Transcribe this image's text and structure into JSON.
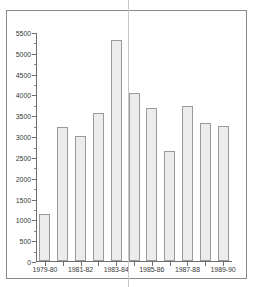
{
  "chart_data": {
    "type": "bar",
    "title": "",
    "subtitle": "",
    "xlabel": "",
    "ylabel": "",
    "categories": [
      "1979-80",
      "1980-81",
      "1981-82",
      "1982-83",
      "1983-84",
      "1984-85",
      "1985-86",
      "1986-87",
      "1987-88",
      "1988-89",
      "1989-90"
    ],
    "values": [
      1120,
      3220,
      3000,
      3560,
      5300,
      4030,
      3670,
      2650,
      3720,
      3320,
      3250
    ],
    "ylim": [
      0,
      5500
    ],
    "ytick_labels": [
      "0",
      "500",
      "1000",
      "1500",
      "2000",
      "2500",
      "3000",
      "3500",
      "4000",
      "4500",
      "5000",
      "5500"
    ],
    "ytick_values": [
      0,
      500,
      1000,
      1500,
      2000,
      2500,
      3000,
      3500,
      4000,
      4500,
      5000,
      5500
    ],
    "xtick_labels_shown": [
      "1979-80",
      "1981-82",
      "1983-84",
      "1985-86",
      "1987-88",
      "1989-90"
    ],
    "grid": false,
    "legend": null,
    "legend_position": "none",
    "bar_fill_color": "#ececec",
    "bar_border_color": "#9a9a9a",
    "axis_color": "#6e6e6e",
    "frame_color": "#8a8a8a",
    "text_color": "#3a3a3a",
    "annotations": [
      "vertical guide line overlay near 1983-84"
    ]
  }
}
